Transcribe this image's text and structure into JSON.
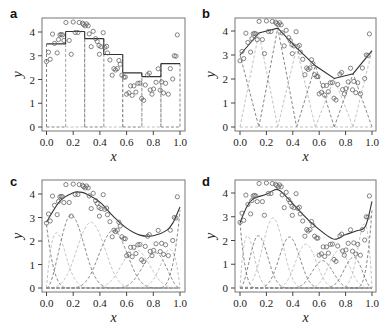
{
  "figure": {
    "panels": [
      "a",
      "b",
      "c",
      "d"
    ],
    "xlabel": "x",
    "ylabel": "y",
    "xticks": [
      "0.0",
      "0.2",
      "0.4",
      "0.6",
      "0.8",
      "1.0"
    ],
    "yticks": [
      "0",
      "1",
      "2",
      "3",
      "4"
    ],
    "colors": {
      "fit": "#333333",
      "basis_dark": "#777777",
      "basis_light": "#bbbbbb",
      "points": "#666666",
      "frame": "#777777"
    }
  },
  "chart_data": [
    {
      "panel": "a",
      "type": "scatter",
      "title": "",
      "xlabel": "x",
      "ylabel": "y",
      "xlim": [
        0,
        1
      ],
      "ylim": [
        0,
        4.5
      ],
      "description": "Piecewise-constant (degree-0 B-spline) fit with 7 box basis functions",
      "knots": [
        0,
        0.143,
        0.286,
        0.429,
        0.571,
        0.714,
        0.857,
        1.0
      ],
      "fit_levels": [
        3.5,
        4.02,
        3.72,
        3.05,
        2.28,
        2.12,
        2.67
      ]
    },
    {
      "panel": "b",
      "type": "line",
      "xlabel": "x",
      "ylabel": "y",
      "xlim": [
        0,
        1
      ],
      "ylim": [
        0,
        4.5
      ],
      "description": "Piecewise-linear (degree-1 B-spline) fit with triangular basis functions",
      "knots": [
        0,
        0.143,
        0.286,
        0.429,
        0.571,
        0.714,
        0.857,
        1.0
      ],
      "fit_values": [
        3.0,
        3.92,
        4.12,
        3.3,
        2.55,
        2.02,
        2.22,
        3.18
      ]
    },
    {
      "panel": "c",
      "type": "line",
      "xlabel": "x",
      "ylabel": "y",
      "xlim": [
        0,
        1
      ],
      "ylim": [
        0,
        4.5
      ],
      "description": "Smooth cubic B-spline fit, fewer basis functions",
      "fit_x": [
        0,
        0.1,
        0.2,
        0.25,
        0.3,
        0.4,
        0.5,
        0.6,
        0.7,
        0.8,
        0.9,
        0.95,
        1.0
      ],
      "fit_y": [
        2.8,
        3.7,
        4.05,
        4.08,
        4.0,
        3.65,
        3.05,
        2.55,
        2.25,
        2.22,
        2.45,
        2.8,
        3.45
      ],
      "basis_peaks": [
        2.7,
        2.35,
        3.1,
        2.8,
        2.45,
        1.65,
        1.5,
        1.65,
        3.3
      ]
    },
    {
      "panel": "d",
      "type": "line",
      "xlabel": "x",
      "ylabel": "y",
      "xlim": [
        0,
        1
      ],
      "ylim": [
        0,
        4.5
      ],
      "description": "Cubic B-spline fit with more basis functions",
      "fit_x": [
        0,
        0.05,
        0.1,
        0.2,
        0.28,
        0.35,
        0.45,
        0.55,
        0.65,
        0.72,
        0.8,
        0.88,
        0.95,
        1.0
      ],
      "fit_y": [
        2.75,
        3.4,
        3.75,
        3.95,
        4.15,
        3.85,
        3.25,
        2.7,
        2.25,
        2.05,
        2.25,
        2.4,
        2.6,
        3.65
      ],
      "basis_peaks": [
        2.75,
        2.2,
        2.2,
        2.95,
        2.15,
        1.85,
        1.15,
        1.6,
        1.3,
        2.7,
        3.3
      ]
    }
  ],
  "points": {
    "x": [
      0.0,
      0.015,
      0.028,
      0.045,
      0.06,
      0.08,
      0.09,
      0.1,
      0.11,
      0.12,
      0.13,
      0.145,
      0.17,
      0.185,
      0.2,
      0.215,
      0.235,
      0.245,
      0.27,
      0.277,
      0.29,
      0.3,
      0.312,
      0.32,
      0.335,
      0.35,
      0.368,
      0.38,
      0.393,
      0.396,
      0.408,
      0.425,
      0.437,
      0.45,
      0.457,
      0.475,
      0.492,
      0.505,
      0.517,
      0.53,
      0.542,
      0.552,
      0.565,
      0.58,
      0.59,
      0.6,
      0.617,
      0.63,
      0.642,
      0.655,
      0.67,
      0.685,
      0.7,
      0.712,
      0.727,
      0.74,
      0.757,
      0.77,
      0.777,
      0.79,
      0.802,
      0.82,
      0.837,
      0.852,
      0.862,
      0.877,
      0.892,
      0.912,
      0.927,
      0.945,
      0.957,
      0.97,
      0.98
    ],
    "y": [
      2.76,
      3.15,
      2.85,
      3.91,
      3.52,
      3.12,
      3.68,
      3.88,
      3.9,
      3.88,
      3.64,
      4.4,
      3.64,
      3.06,
      4.42,
      3.98,
      3.98,
      4.4,
      4.37,
      4.31,
      4.26,
      4.34,
      4.26,
      3.92,
      3.38,
      4.03,
      3.72,
      3.6,
      3.43,
      3.06,
      3.38,
      3.97,
      3.35,
      3.4,
      3.12,
      2.82,
      2.18,
      2.46,
      2.4,
      2.46,
      2.8,
      2.64,
      2.18,
      2.1,
      2.1,
      1.38,
      1.44,
      1.73,
      1.33,
      1.73,
      1.47,
      1.84,
      1.85,
      1.2,
      1.12,
      1.77,
      2.2,
      2.27,
      1.56,
      1.38,
      1.6,
      1.88,
      2.45,
      1.55,
      1.9,
      1.43,
      1.84,
      1.38,
      2.46,
      2.02,
      3.0,
      2.98,
      3.88
    ]
  }
}
